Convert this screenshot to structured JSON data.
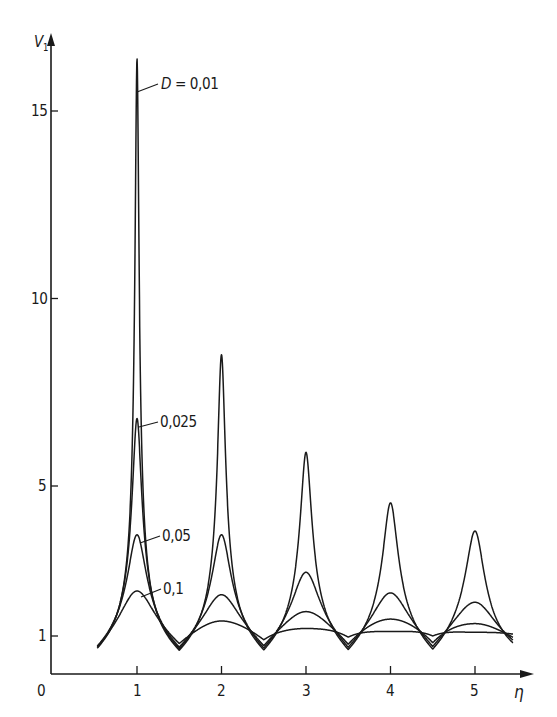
{
  "chart_data": {
    "type": "line",
    "title": "",
    "xlabel": "η",
    "ylabel": "V1",
    "xlim": [
      0,
      5.6
    ],
    "ylim": [
      0,
      17
    ],
    "x_ticks": [
      1,
      2,
      3,
      4,
      5
    ],
    "x_tick_labels": [
      "0",
      "1",
      "2",
      "3",
      "4",
      "5"
    ],
    "y_ticks": [
      1,
      5,
      10,
      15
    ],
    "y_tick_labels": [
      "1",
      "5",
      "10",
      "15"
    ],
    "grid": false,
    "legend": "inline labels with leader lines",
    "x_range_of_curves": [
      0.53,
      5.45
    ],
    "series": [
      {
        "name": "D = 0,01",
        "label": "D = 0,01",
        "peaks_eta": [
          1,
          2,
          3,
          4,
          5
        ],
        "peaks": [
          16.4,
          8.5,
          5.9,
          4.55,
          3.8
        ],
        "minima": [
          0.6,
          0.62,
          0.63,
          0.64,
          0.65,
          0.68
        ],
        "end_value": 0.72
      },
      {
        "name": "D = 0,025",
        "label": "0,025",
        "peaks_eta": [
          1,
          2,
          3,
          4,
          5
        ],
        "peaks": [
          6.8,
          3.7,
          2.7,
          2.15,
          1.9
        ],
        "minima": [
          0.62,
          0.66,
          0.68,
          0.7,
          0.72,
          0.76
        ],
        "end_value": 0.8
      },
      {
        "name": "D = 0,05",
        "label": "0,05",
        "peaks_eta": [
          1,
          2,
          3,
          4,
          5
        ],
        "peaks": [
          3.7,
          2.1,
          1.65,
          1.45,
          1.33
        ],
        "minima": [
          0.64,
          0.7,
          0.74,
          0.78,
          0.82,
          0.87
        ],
        "end_value": 0.9
      },
      {
        "name": "D = 0,1",
        "label": "0,1",
        "peaks_eta": [
          1,
          2,
          3,
          4,
          5
        ],
        "peaks": [
          2.2,
          1.4,
          1.2,
          1.12,
          1.1
        ],
        "minima": [
          0.66,
          0.8,
          0.9,
          0.97,
          1.0,
          1.02
        ],
        "end_value": 1.03
      }
    ]
  },
  "axes": {
    "origin_label": "0",
    "x_axis_label": "η",
    "y_axis_label": "V",
    "y_axis_subscript": "1"
  },
  "labels": {
    "d001": "D = 0,01",
    "d001_prefix": "D",
    "d001_value": "= 0,01",
    "d0025": "0,025",
    "d005": "0,05",
    "d01": "0,1"
  },
  "colors": {
    "ink": "#1a1a1a",
    "background": "#ffffff"
  }
}
